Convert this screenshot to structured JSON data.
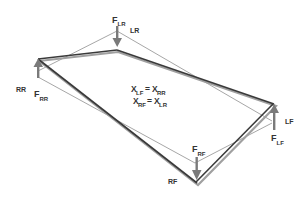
{
  "diagram": {
    "type": "chassis-weight-transfer",
    "colors": {
      "frame_dark": "#3a3a3a",
      "frame_shadow": "#9a9a9a",
      "reference_lines": "#6a6a6a",
      "arrows": "#7a7a7a",
      "text": "#333333",
      "background": "#ffffff"
    },
    "corners": {
      "RR": {
        "label": "RR",
        "force_main": "F",
        "force_sub": "RR",
        "direction": "up"
      },
      "LR": {
        "label": "LR",
        "force_main": "F",
        "force_sub": "LR",
        "direction": "down"
      },
      "LF": {
        "label": "LF",
        "force_main": "F",
        "force_sub": "LF",
        "direction": "up"
      },
      "RF": {
        "label": "RF",
        "force_main": "F",
        "force_sub": "RF",
        "direction": "down"
      }
    },
    "equations": [
      {
        "lhs_main": "X",
        "lhs_sub": "LF",
        "op": "=",
        "rhs_main": "X",
        "rhs_sub": "RR"
      },
      {
        "lhs_main": "X",
        "lhs_sub": "RF",
        "op": "=",
        "rhs_main": "X",
        "rhs_sub": "LR"
      }
    ]
  }
}
